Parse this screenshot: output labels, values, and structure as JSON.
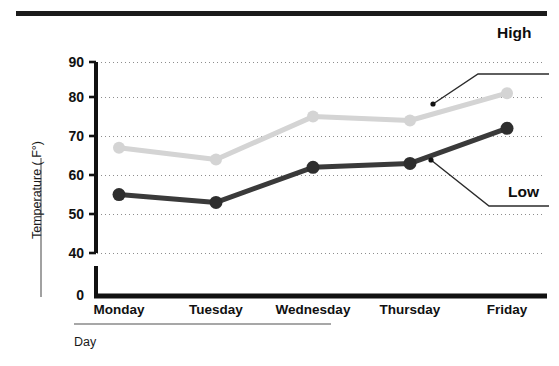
{
  "chart_data": {
    "type": "line",
    "title": "",
    "subtitle": "",
    "xlabel": "Day",
    "ylabel": "Temperature ( F°)",
    "categories": [
      "Monday",
      "Tuesday",
      "Wednesday",
      "Thursday",
      "Friday"
    ],
    "series": [
      {
        "name": "High",
        "color": "#d4d4d4",
        "values": [
          68,
          65,
          76,
          75,
          82
        ]
      },
      {
        "name": "Low",
        "color": "#3a3a3a",
        "values": [
          56,
          54,
          63,
          64,
          73
        ]
      }
    ],
    "ylim": [
      0,
      90
    ],
    "yticks": [
      0,
      40,
      50,
      60,
      70,
      80,
      90
    ],
    "ytick_labels": [
      "0",
      "40",
      "50",
      "60",
      "70",
      "80",
      "90"
    ],
    "axis_break": true,
    "grid": true,
    "grid_style": "dotted",
    "legend_position": "annotations",
    "annotations": [
      {
        "text": "High",
        "series": "High",
        "points_to": "Friday-high-segment"
      },
      {
        "text": "Low",
        "series": "Low",
        "points_to": "Friday-low-segment"
      }
    ]
  },
  "axis": {
    "y_title": "Temperature ( F°)",
    "x_title": "Day",
    "y_labels": [
      "90",
      "80",
      "70",
      "60",
      "50",
      "40",
      "0"
    ],
    "x_labels": [
      "Monday",
      "Tuesday",
      "Wednesday",
      "Thursday",
      "Friday"
    ]
  },
  "annotations": {
    "high_label": "High",
    "low_label": "Low"
  },
  "colors": {
    "high_line": "#d4d4d4",
    "low_line": "#3a3a3a",
    "axis": "#111111",
    "grid": "#999999",
    "top_rule": "#1b1b1b",
    "background": "#ffffff"
  }
}
